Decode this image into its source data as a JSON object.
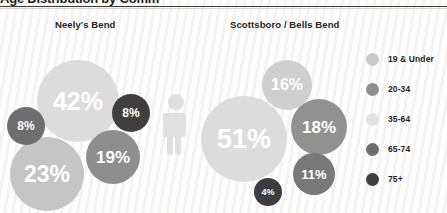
{
  "title": "Age Distribution by Community",
  "columns": [
    {
      "label": "Neely's Bend"
    },
    {
      "label": "Scottsboro / Bells Bend"
    }
  ],
  "legend": {
    "items": [
      {
        "label": "19 & Under",
        "color": "#c9c9c9"
      },
      {
        "label": "20-34",
        "color": "#8e8e8e"
      },
      {
        "label": "35-64",
        "color": "#e2e2e2"
      },
      {
        "label": "65-74",
        "color": "#6e6e6e"
      },
      {
        "label": "75+",
        "color": "#3f3f3f"
      }
    ]
  },
  "icons": {
    "person": "person-icon",
    "person_color": "#e0e0e0"
  },
  "chart_data": {
    "type": "bubble",
    "title": "Age Distribution by Community",
    "legend_position": "right",
    "groups": [
      {
        "name": "Neely's Bend",
        "bubbles": [
          {
            "category": "35-64",
            "value": 42,
            "label": "42%",
            "color": "#dcdcdc",
            "x": 78,
            "y": 101,
            "r": 41
          },
          {
            "category": "19 & Under",
            "value": 23,
            "label": "23%",
            "color": "#c5c5c5",
            "x": 47,
            "y": 174,
            "r": 37
          },
          {
            "category": "20-34",
            "value": 19,
            "label": "19%",
            "color": "#8e8e8e",
            "x": 113,
            "y": 157,
            "r": 27
          },
          {
            "category": "65-74",
            "value": 8,
            "label": "8%",
            "color": "#6e6e6e",
            "x": 26,
            "y": 126,
            "r": 19
          },
          {
            "category": "75+",
            "value": 8,
            "label": "8%",
            "color": "#3f3f3f",
            "x": 131,
            "y": 113,
            "r": 19
          }
        ]
      },
      {
        "name": "Scottsboro / Bells Bend",
        "bubbles": [
          {
            "category": "35-64",
            "value": 51,
            "label": "51%",
            "color": "#dcdcdc",
            "x": 244,
            "y": 139,
            "r": 43
          },
          {
            "category": "19 & Under",
            "value": 16,
            "label": "16%",
            "color": "#cfcfcf",
            "x": 287,
            "y": 85,
            "r": 25
          },
          {
            "category": "20-34",
            "value": 18,
            "label": "18%",
            "color": "#919191",
            "x": 319,
            "y": 127,
            "r": 28
          },
          {
            "category": "65-74",
            "value": 11,
            "label": "11%",
            "color": "#787878",
            "x": 314,
            "y": 174,
            "r": 21
          },
          {
            "category": "75+",
            "value": 4,
            "label": "4%",
            "color": "#3d3d3d",
            "x": 268,
            "y": 192,
            "r": 14
          }
        ]
      }
    ]
  }
}
